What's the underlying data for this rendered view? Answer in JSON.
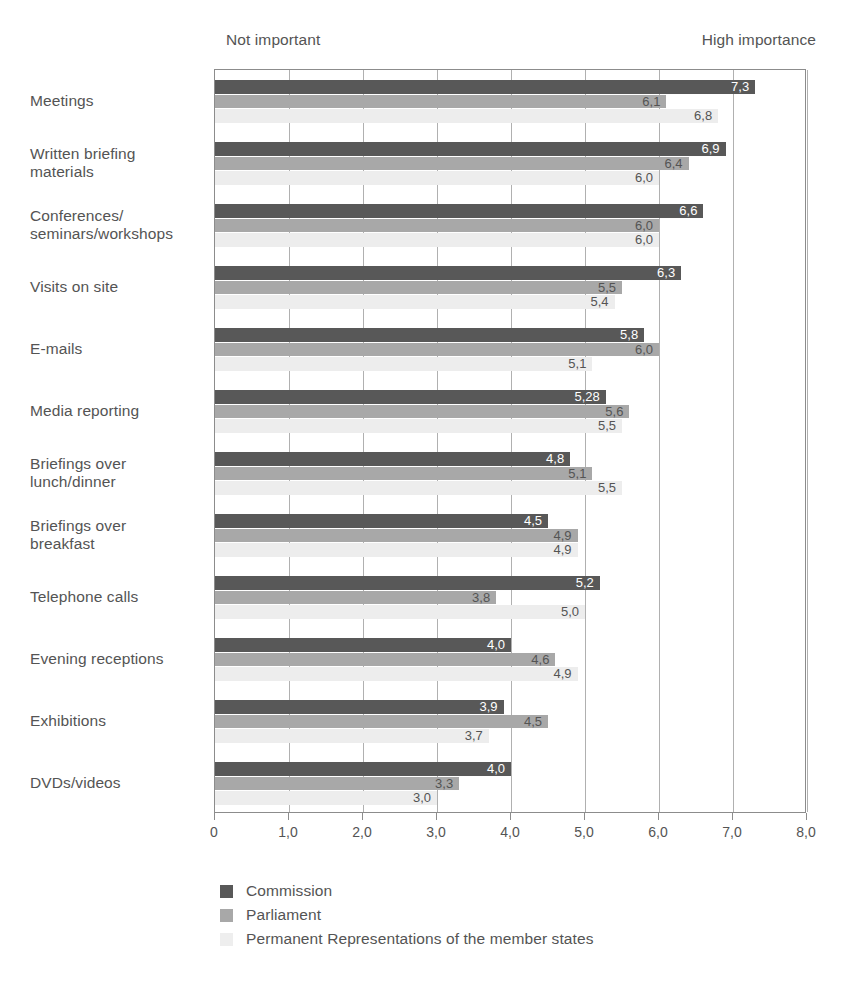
{
  "header": {
    "low_caption": "Not important",
    "high_caption": "High importance"
  },
  "legend": {
    "position": "bottom-left",
    "items": [
      {
        "label": "Commission",
        "color": "#585858"
      },
      {
        "label": "Parliament",
        "color": "#a8a8a8"
      },
      {
        "label": "Permanent Representations of the member states",
        "color": "#eeeeee"
      }
    ]
  },
  "axis": {
    "ticks": [
      "0",
      "1,0",
      "2,0",
      "3,0",
      "4,0",
      "5,0",
      "6,0",
      "7,0",
      "8,0"
    ],
    "min": 0,
    "max": 8
  },
  "chart_data": {
    "type": "bar",
    "orientation": "horizontal",
    "title": "",
    "subtitle": "",
    "xlabel": "",
    "ylabel": "",
    "xlim": [
      0,
      8
    ],
    "grid": true,
    "legend_position": "bottom-left",
    "annotations": [
      "Not important",
      "High importance"
    ],
    "value_format": "comma-decimal",
    "categories": [
      "Meetings",
      "Written briefing materials",
      "Conferences/ seminars/workshops",
      "Visits on site",
      "E-mails",
      "Media reporting",
      "Briefings over lunch/dinner",
      "Briefings over breakfast",
      "Telephone calls",
      "Evening receptions",
      "Exhibitions",
      "DVDs/videos"
    ],
    "category_lines": [
      [
        "Meetings"
      ],
      [
        "Written briefing",
        "materials"
      ],
      [
        "Conferences/",
        "seminars/workshops"
      ],
      [
        "Visits on site"
      ],
      [
        "E-mails"
      ],
      [
        "Media reporting"
      ],
      [
        "Briefings over",
        "lunch/dinner"
      ],
      [
        "Briefings over",
        "breakfast"
      ],
      [
        "Telephone calls"
      ],
      [
        "Evening receptions"
      ],
      [
        "Exhibitions"
      ],
      [
        "DVDs/videos"
      ]
    ],
    "series": [
      {
        "name": "Commission",
        "color": "#585858",
        "values": [
          7.3,
          6.9,
          6.6,
          6.3,
          5.8,
          5.28,
          4.8,
          4.5,
          5.2,
          4.0,
          3.9,
          4.0
        ],
        "labels": [
          "7,3",
          "6,9",
          "6,6",
          "6,3",
          "5,8",
          "5,28",
          "4,8",
          "4,5",
          "5,2",
          "4,0",
          "3,9",
          "4,0"
        ]
      },
      {
        "name": "Parliament",
        "color": "#a8a8a8",
        "values": [
          6.1,
          6.4,
          6.0,
          5.5,
          6.0,
          5.6,
          5.1,
          4.9,
          3.8,
          4.6,
          4.5,
          3.3
        ],
        "labels": [
          "6,1",
          "6,4",
          "6,0",
          "5,5",
          "6,0",
          "5,6",
          "5,1",
          "4,9",
          "3,8",
          "4,6",
          "4,5",
          "3,3"
        ]
      },
      {
        "name": "Permanent Representations of the member states",
        "color": "#eeeeee",
        "values": [
          6.8,
          6.0,
          6.0,
          5.4,
          5.1,
          5.5,
          5.5,
          4.9,
          5.0,
          4.9,
          3.7,
          3.0
        ],
        "labels": [
          "6,8",
          "6,0",
          "6,0",
          "5,4",
          "5,1",
          "5,5",
          "5,5",
          "4,9",
          "5,0",
          "4,9",
          "3,7",
          "3,0"
        ]
      }
    ]
  }
}
